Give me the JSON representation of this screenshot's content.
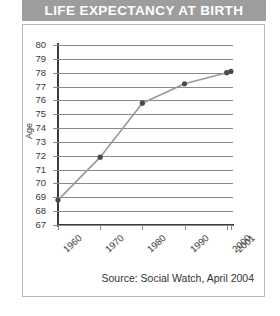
{
  "title": "LIFE EXPECTANCY AT BIRTH",
  "source_note": "Source: Social Watch, April 2004",
  "theme": {
    "title_band_bg": "#9d9d9d",
    "title_color": "#ffffff",
    "frame_border": "#b9b9b9",
    "grid_color": "#8a8a8a",
    "axis_color": "#3a3a3a",
    "line_color": "#9a9a9a",
    "marker_color": "#4a4a4a",
    "text_color": "#3a3a3a"
  },
  "chart_data": {
    "type": "line",
    "title": "LIFE EXPECTANCY AT BIRTH",
    "xlabel": "",
    "ylabel": "Age",
    "x": [
      "1960",
      "1970",
      "1980",
      "1990",
      "2000",
      "2001"
    ],
    "categories": [
      "1960",
      "1970",
      "1980",
      "1990",
      "2000",
      "2001"
    ],
    "values": [
      68.8,
      71.9,
      75.8,
      77.2,
      78.0,
      78.1
    ],
    "series": [
      {
        "name": "Life expectancy at birth",
        "values": [
          68.8,
          71.9,
          75.8,
          77.2,
          78.0,
          78.1
        ]
      }
    ],
    "ylim": [
      67,
      80
    ],
    "yticks": [
      80,
      79,
      78,
      77,
      76,
      75,
      74,
      73,
      72,
      71,
      70,
      69,
      68,
      67
    ],
    "ytick_labels": [
      "80",
      "79",
      "78",
      "77",
      "76",
      "75",
      "74",
      "73",
      "72",
      "71",
      "70",
      "69",
      "68",
      "67"
    ],
    "xtick_labels": [
      "1960",
      "1970",
      "1980",
      "1990",
      "2000",
      "2001"
    ],
    "grid": true,
    "grid_axis": "y",
    "legend": false,
    "legend_position": "none",
    "markers": true,
    "annotations": []
  }
}
